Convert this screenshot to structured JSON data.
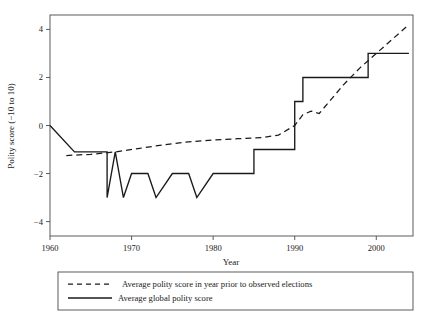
{
  "chart_data": {
    "type": "line",
    "title": "",
    "xlabel": "Year",
    "ylabel": "Polity score (−10 to 10)",
    "xlim": [
      1960,
      2004.5
    ],
    "ylim": [
      -4.6,
      4.6
    ],
    "xticks": [
      1960,
      1970,
      1980,
      1990,
      2000
    ],
    "xticklabels": [
      "1960",
      "1970",
      "1980",
      "1990",
      "2000"
    ],
    "yticks": [
      4,
      2,
      0,
      -2,
      -4
    ],
    "yticklabels": [
      "4",
      "2",
      "0",
      "−2",
      "−4"
    ],
    "grid": false,
    "legend_position": "below-plot",
    "series": [
      {
        "name": "Average polity score in year prior to observed elections",
        "style": "dashed",
        "color": "#1a1a1a",
        "points": [
          [
            1962,
            -1.25
          ],
          [
            1965,
            -1.2
          ],
          [
            1968,
            -1.1
          ],
          [
            1971,
            -0.95
          ],
          [
            1974,
            -0.8
          ],
          [
            1977,
            -0.68
          ],
          [
            1980,
            -0.6
          ],
          [
            1983,
            -0.55
          ],
          [
            1986,
            -0.5
          ],
          [
            1988,
            -0.4
          ],
          [
            1990,
            0.0
          ],
          [
            1991,
            0.45
          ],
          [
            1992,
            0.6
          ],
          [
            1993,
            0.5
          ],
          [
            1994,
            0.9
          ],
          [
            1996,
            1.7
          ],
          [
            1998,
            2.4
          ],
          [
            2000,
            3.0
          ],
          [
            2002,
            3.6
          ],
          [
            2004,
            4.2
          ]
        ]
      },
      {
        "name": "Average global polity score",
        "style": "solid",
        "color": "#1a1a1a",
        "points": [
          [
            1960,
            0.0
          ],
          [
            1963,
            -1.1
          ],
          [
            1967,
            -1.1
          ],
          [
            1967,
            -3.0
          ],
          [
            1968,
            -1.1
          ],
          [
            1969,
            -3.0
          ],
          [
            1970,
            -2.0
          ],
          [
            1972,
            -2.0
          ],
          [
            1973,
            -3.0
          ],
          [
            1975,
            -2.0
          ],
          [
            1977,
            -2.0
          ],
          [
            1978,
            -3.0
          ],
          [
            1980,
            -2.0
          ],
          [
            1985,
            -2.0
          ],
          [
            1985,
            -1.0
          ],
          [
            1990,
            -1.0
          ],
          [
            1990,
            1.0
          ],
          [
            1991,
            1.0
          ],
          [
            1991,
            2.0
          ],
          [
            1996,
            2.0
          ],
          [
            1999,
            2.0
          ],
          [
            1999,
            3.0
          ],
          [
            2004,
            3.0
          ]
        ]
      }
    ]
  },
  "legend": {
    "entries": [
      {
        "label": "Average polity score in year prior to observed elections",
        "style": "dashed"
      },
      {
        "label": "Average global polity score",
        "style": "solid"
      }
    ]
  }
}
